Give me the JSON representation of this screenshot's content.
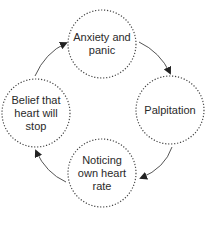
{
  "diagram": {
    "type": "cycle",
    "colors": {
      "stroke": "#444444",
      "text": "#2a2a2a",
      "background": "#ffffff"
    },
    "nodes": [
      {
        "id": "anxiety",
        "label": "Anxiety and panic",
        "cx": 102,
        "cy": 44,
        "r": 34
      },
      {
        "id": "palpitation",
        "label": "Palpitation",
        "cx": 170,
        "cy": 110,
        "r": 34
      },
      {
        "id": "noticing",
        "label": "Noticing own heart rate",
        "cx": 102,
        "cy": 173,
        "r": 34
      },
      {
        "id": "belief",
        "label": "Belief that heart will stop",
        "cx": 36,
        "cy": 113,
        "r": 34
      }
    ],
    "edges": [
      {
        "from": "anxiety",
        "to": "palpitation"
      },
      {
        "from": "palpitation",
        "to": "noticing"
      },
      {
        "from": "noticing",
        "to": "belief"
      },
      {
        "from": "belief",
        "to": "anxiety"
      }
    ]
  }
}
